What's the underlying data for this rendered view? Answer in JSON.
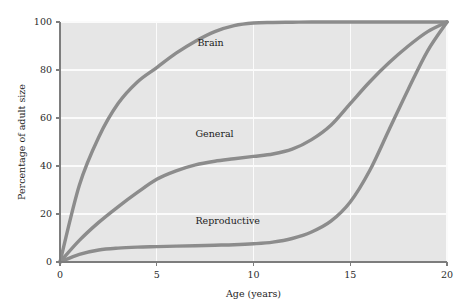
{
  "chart_data": {
    "type": "line",
    "title": "",
    "subtitle": "",
    "xlabel": "Age (years)",
    "ylabel": "Percentage of adult size",
    "xlim": [
      0,
      20
    ],
    "ylim": [
      0,
      100
    ],
    "xticks": [
      0,
      5,
      10,
      15,
      20
    ],
    "xtick_labels": [
      "0",
      "5",
      "10",
      "15",
      "20"
    ],
    "yticks": [
      0,
      20,
      40,
      60,
      80,
      100
    ],
    "ytick_labels": [
      "0",
      "20",
      "40",
      "60",
      "80",
      "100"
    ],
    "grid": true,
    "grid_color": "#fbfbfb",
    "plot_background": "#e6e6e6",
    "line_color": "#8c8c8c",
    "legend_position": "inline-annotations",
    "x": [
      0,
      1,
      2,
      3,
      4,
      5,
      6,
      7,
      8,
      9,
      10,
      11,
      12,
      13,
      14,
      15,
      16,
      17,
      18,
      19,
      20
    ],
    "series": [
      {
        "name": "Brain",
        "label": "Brain",
        "label_x": 7.1,
        "label_y": 90,
        "values": [
          0,
          32,
          52,
          66,
          75,
          81,
          87,
          92,
          96,
          98.5,
          99.6,
          99.8,
          99.9,
          100,
          100,
          100,
          100,
          100,
          100,
          100,
          100
        ]
      },
      {
        "name": "General",
        "label": "General",
        "label_x": 7.0,
        "label_y": 52,
        "values": [
          0,
          9,
          16.5,
          23,
          29,
          34.5,
          38,
          40.5,
          42,
          43,
          44,
          45,
          47,
          51,
          57,
          66,
          75,
          83,
          90,
          96,
          100
        ]
      },
      {
        "name": "Reproductive",
        "label": "Reproductive",
        "label_x": 7.0,
        "label_y": 16,
        "values": [
          0,
          3.2,
          5.0,
          5.8,
          6.2,
          6.4,
          6.6,
          6.8,
          7.0,
          7.2,
          7.6,
          8.3,
          9.8,
          12.5,
          17,
          25,
          38,
          55,
          72,
          88,
          100
        ]
      }
    ],
    "annotations": [
      {
        "text": "Brain",
        "x": 7.1,
        "y": 90
      },
      {
        "text": "General",
        "x": 7.0,
        "y": 52
      },
      {
        "text": "Reproductive",
        "x": 7.0,
        "y": 16
      }
    ]
  }
}
